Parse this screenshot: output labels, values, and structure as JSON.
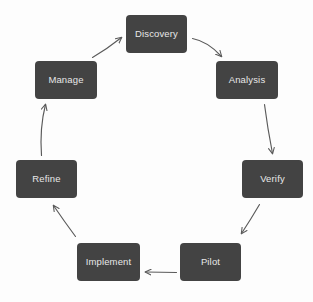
{
  "diagram": {
    "type": "cycle",
    "title": "",
    "background_color": "#fdfdfd",
    "node_fill_color": "#434343",
    "node_text_color": "#e8e8e8",
    "arrow_color": "#5a5a5a",
    "nodes": [
      {
        "id": "discovery",
        "label": "Discovery",
        "x": 126,
        "y": 15,
        "w": 61,
        "h": 38
      },
      {
        "id": "analysis",
        "label": "Analysis",
        "x": 216,
        "y": 61,
        "w": 62,
        "h": 38
      },
      {
        "id": "verify",
        "label": "Verify",
        "x": 242,
        "y": 160,
        "w": 61,
        "h": 38
      },
      {
        "id": "pilot",
        "label": "Pilot",
        "x": 180,
        "y": 243,
        "w": 61,
        "h": 38
      },
      {
        "id": "implement",
        "label": "Implement",
        "x": 77,
        "y": 243,
        "w": 63,
        "h": 38
      },
      {
        "id": "refine",
        "label": "Refine",
        "x": 16,
        "y": 160,
        "w": 61,
        "h": 38
      },
      {
        "id": "manage",
        "label": "Manage",
        "x": 35,
        "y": 61,
        "w": 62,
        "h": 38
      }
    ],
    "edges": [
      {
        "id": "discovery-to-analysis",
        "from": "discovery",
        "to": "analysis"
      },
      {
        "id": "analysis-to-verify",
        "from": "analysis",
        "to": "verify"
      },
      {
        "id": "verify-to-pilot",
        "from": "verify",
        "to": "pilot"
      },
      {
        "id": "pilot-to-implement",
        "from": "pilot",
        "to": "implement"
      },
      {
        "id": "implement-to-refine",
        "from": "implement",
        "to": "refine"
      },
      {
        "id": "refine-to-manage",
        "from": "refine",
        "to": "manage"
      },
      {
        "id": "manage-to-discovery",
        "from": "manage",
        "to": "discovery"
      }
    ]
  }
}
